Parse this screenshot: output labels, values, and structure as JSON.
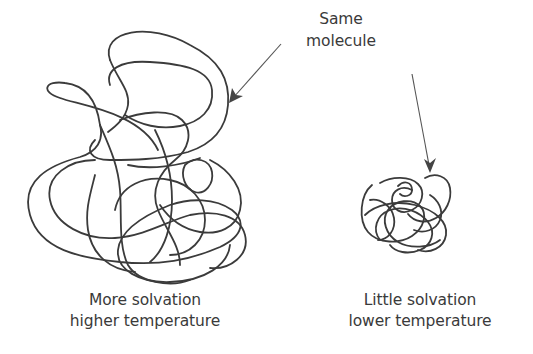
{
  "diagram": {
    "type": "schematic",
    "callout": {
      "line1": "Same",
      "line2": "molecule",
      "points_to": [
        "large-coil",
        "small-coil"
      ]
    },
    "left": {
      "line1": "More solvation",
      "line2": "higher temperature",
      "depiction": "large expanded random coil"
    },
    "right": {
      "line1": "Little solvation",
      "line2": "lower temperature",
      "depiction": "small compact random coil"
    },
    "colors": {
      "background": "#ffffff",
      "stroke": "#3b3b3b",
      "text": "#3a3a3a"
    }
  }
}
